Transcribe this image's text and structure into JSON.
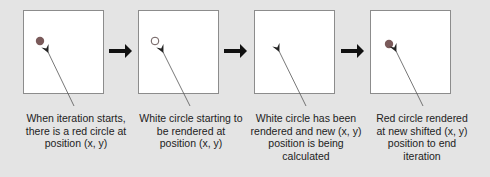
{
  "diagram": {
    "steps": [
      {
        "id": 1,
        "circle": "red",
        "caption": "When iteration starts, there is a red circle at position (x, y)"
      },
      {
        "id": 2,
        "circle": "white",
        "caption": "White circle starting to be rendered at position (x, y)"
      },
      {
        "id": 3,
        "circle": "none",
        "caption": "White circle has been rendered  and new (x, y) position is being calculated"
      },
      {
        "id": 4,
        "circle": "red",
        "caption": "Red circle rendered at new shifted (x, y) position to end iteration"
      }
    ],
    "colors": {
      "background": "#e4e4e4",
      "frame": "#ffffff",
      "red_circle": "#7a5a5a",
      "arrow": "#111111"
    }
  }
}
